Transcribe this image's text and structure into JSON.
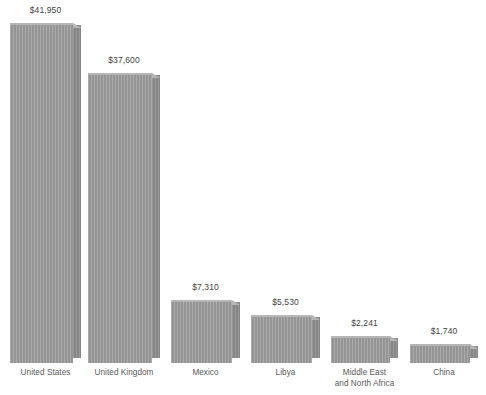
{
  "chart_data": {
    "type": "bar",
    "title": "",
    "subtitle": "",
    "xlabel": "",
    "ylabel": "",
    "grid": false,
    "legend": "none",
    "axis_visible": false,
    "value_prefix": "$",
    "categories": [
      "United States",
      "United Kingdom",
      "Mexico",
      "Libya",
      "Middle East\nand North Africa",
      "China"
    ],
    "values": [
      41950,
      37600,
      7310,
      5530,
      2241,
      1740
    ],
    "value_labels": [
      "$41,950",
      "$37,600",
      "$7,310",
      "$5,530",
      "$2,241",
      "$1,740"
    ],
    "ylim": [
      0,
      45000
    ],
    "colors": {
      "bar_front": "#9b9b9b",
      "bar_top": "#b6b6b6",
      "bar_side": "#8d8d8d",
      "value_text": "#3f3f41",
      "category_text": "#58585a",
      "background": "#ffffff"
    },
    "bars": [
      {
        "name": "united-states",
        "label": "United States",
        "value_label": "$41,950",
        "left": 10,
        "width": 63,
        "top": 20,
        "baseline": 358
      },
      {
        "name": "united-kingdom",
        "label": "United Kingdom",
        "value_label": "$37,600",
        "left": 88,
        "width": 64,
        "top": 70,
        "baseline": 358
      },
      {
        "name": "mexico",
        "label": "Mexico",
        "value_label": "$7,310",
        "left": 171,
        "width": 61,
        "top": 297,
        "baseline": 358
      },
      {
        "name": "libya",
        "label": "Libya",
        "value_label": "$5,530",
        "left": 251,
        "width": 61,
        "top": 312,
        "baseline": 358
      },
      {
        "name": "middle-east-and-north-africa",
        "label": "Middle East\nand North Africa",
        "value_label": "$2,241",
        "left": 331,
        "width": 59,
        "top": 333,
        "baseline": 358
      },
      {
        "name": "china",
        "label": "China",
        "value_label": "$1,740",
        "left": 410,
        "width": 60,
        "top": 341,
        "baseline": 358
      }
    ]
  }
}
